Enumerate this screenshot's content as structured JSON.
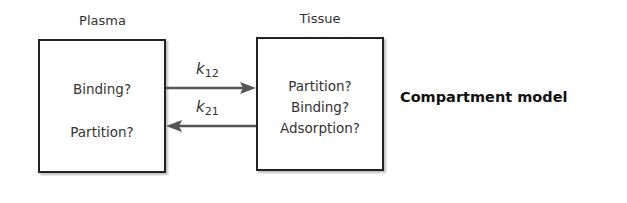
{
  "diagram": {
    "title": "Compartment model",
    "compartments": [
      {
        "id": "plasma",
        "label": "Plasma",
        "processes": [
          "Binding?",
          "Partition?"
        ]
      },
      {
        "id": "tissue",
        "label": "Tissue",
        "processes": [
          "Partition?",
          "Binding?",
          "Adsorption?"
        ]
      }
    ],
    "edges": [
      {
        "from": "plasma",
        "to": "tissue",
        "rate_symbol": "k",
        "rate_subscript": "12"
      },
      {
        "from": "tissue",
        "to": "plasma",
        "rate_symbol": "k",
        "rate_subscript": "21"
      }
    ],
    "colors": {
      "border": "#222222",
      "arrow": "#555555",
      "text": "#333333"
    }
  }
}
